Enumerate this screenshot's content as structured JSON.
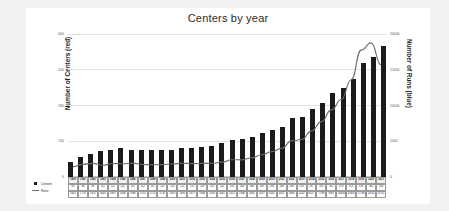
{
  "chart_data": {
    "type": "bar",
    "title": "Centers by year",
    "xlabel": "",
    "ylabel": "Number of Centers (red)",
    "y2label": "Number of Runs (blue)",
    "ylim": [
      0,
      600
    ],
    "y2lim": [
      0,
      20000
    ],
    "yticks": [
      "0",
      "150",
      "300",
      "450",
      "600"
    ],
    "y2ticks": [
      "0",
      "5000",
      "10000",
      "15000",
      "20000"
    ],
    "grid": true,
    "legend_position": "bottom-left",
    "categories": [
      "1990",
      "1991",
      "1992",
      "1993",
      "1994",
      "1995",
      "1996",
      "1997",
      "1998",
      "1999",
      "2000",
      "2001",
      "2002",
      "2003",
      "2004",
      "2005",
      "2006",
      "2007",
      "2008",
      "2009",
      "2010",
      "2011",
      "2012",
      "2013",
      "2014",
      "2015",
      "2016",
      "2017",
      "2018",
      "2019",
      "2020",
      "2021"
    ],
    "series": [
      {
        "name": "Centers",
        "axis": "left",
        "render": "bar",
        "color": "#1b1b1b",
        "values": [
          63,
          86,
          98,
          111,
          112,
          122,
          115,
          112,
          115,
          115,
          115,
          121,
          122,
          128,
          132,
          142,
          155,
          160,
          166,
          185,
          196,
          209,
          248,
          253,
          287,
          311,
          351,
          374,
          413,
          478,
          502,
          548
        ]
      },
      {
        "name": "Runs",
        "axis": "right",
        "render": "line",
        "color": "#6b6b6b",
        "values": [
          1441,
          1770,
          1911,
          1643,
          1887,
          1856,
          1938,
          1755,
          1715,
          1732,
          1823,
          1930,
          1877,
          1900,
          1918,
          2082,
          2421,
          2396,
          2692,
          3107,
          3542,
          4017,
          5048,
          5242,
          6417,
          7748,
          9387,
          10840,
          13605,
          17746,
          18762,
          15711
        ]
      }
    ]
  },
  "legend": {
    "items": [
      {
        "label": "Centers",
        "marker": "square"
      },
      {
        "label": "Runs",
        "marker": "line"
      }
    ]
  }
}
